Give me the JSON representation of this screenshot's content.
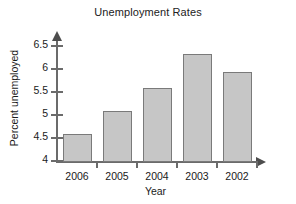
{
  "chart_data": {
    "type": "bar",
    "title": "Unemployment Rates",
    "xlabel": "Year",
    "ylabel": "Percent unemployed",
    "categories": [
      "2006",
      "2005",
      "2004",
      "2003",
      "2002"
    ],
    "values": [
      4.6,
      5.1,
      5.6,
      6.35,
      5.95
    ],
    "series": [
      {
        "name": "Percent unemployed",
        "values": [
          4.6,
          5.1,
          5.6,
          6.35,
          5.95
        ]
      }
    ],
    "ylim": [
      4,
      6.5
    ],
    "ytick_labels": [
      "4",
      "4.5",
      "5",
      "5.5",
      "6",
      "6.5"
    ],
    "ytick_values": [
      4,
      4.5,
      5,
      5.5,
      6,
      6.5
    ],
    "grid": false,
    "legend": null,
    "bar_fill_color": "#c6c6c6",
    "bar_border_color": "#7a7a7a",
    "axis_color": "#6b6b6b",
    "background_color": "#ffffff"
  }
}
